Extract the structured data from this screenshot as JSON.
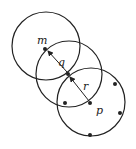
{
  "diagram": {
    "colors": {
      "stroke": "#222222",
      "background": "#ffffff"
    },
    "circles": [
      {
        "name": "circle-m",
        "cx": 46,
        "cy": 46,
        "r": 34
      },
      {
        "name": "circle-q",
        "cx": 69,
        "cy": 74,
        "r": 33
      },
      {
        "name": "circle-p",
        "cx": 91,
        "cy": 102,
        "r": 34
      }
    ],
    "points": [
      {
        "name": "m",
        "x": 45,
        "y": 49
      },
      {
        "name": "q",
        "x": 68,
        "y": 74
      },
      {
        "name": "p",
        "x": 90,
        "y": 103
      },
      {
        "name": "pt1",
        "x": 65,
        "y": 103
      },
      {
        "name": "pt2",
        "x": 115,
        "y": 84
      },
      {
        "name": "pt3",
        "x": 120,
        "y": 113
      },
      {
        "name": "pt4",
        "x": 90,
        "y": 135
      }
    ],
    "labels": {
      "m": "m",
      "q": "q",
      "r": "r",
      "p": "p"
    }
  }
}
